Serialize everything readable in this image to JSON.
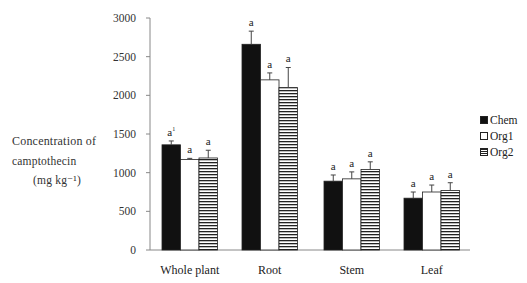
{
  "chart_data": {
    "type": "bar",
    "title": "",
    "xlabel": "",
    "ylabel": "Concentration of camptothecin (mg kg⁻¹)",
    "ylabel_lines": [
      "Concentration of",
      "camptothecin",
      "(mg kg⁻¹)"
    ],
    "ylim": [
      0,
      3000
    ],
    "yticks": [
      0,
      500,
      1000,
      1500,
      2000,
      2500,
      3000
    ],
    "grid": false,
    "legend_position": "right",
    "categories": [
      "Whole plant",
      "Root",
      "Stem",
      "Leaf"
    ],
    "series": [
      {
        "name": "Chem",
        "fill": "solid-black",
        "values": [
          1360,
          2660,
          890,
          670
        ],
        "errors": [
          50,
          170,
          80,
          80
        ],
        "labels": [
          "a¹",
          "a",
          "a",
          "a"
        ]
      },
      {
        "name": "Org1",
        "fill": "white",
        "values": [
          1170,
          2200,
          920,
          750
        ],
        "errors": [
          15,
          90,
          90,
          90
        ],
        "labels": [
          "a",
          "a",
          "a",
          "a"
        ]
      },
      {
        "name": "Org2",
        "fill": "horizontal-stripes",
        "values": [
          1190,
          2100,
          1040,
          770
        ],
        "errors": [
          100,
          260,
          100,
          100
        ],
        "labels": [
          "a",
          "a",
          "a",
          "a"
        ]
      }
    ]
  },
  "colors": {
    "axis": "#888888",
    "bar_dark": "#111111",
    "stripe": "#222222",
    "text": "#222222"
  }
}
